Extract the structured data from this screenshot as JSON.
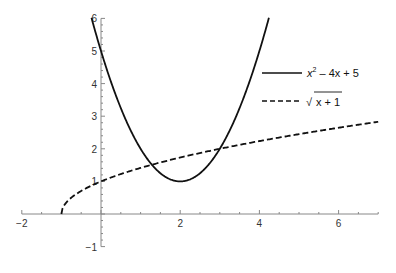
{
  "chart_data": {
    "type": "line",
    "title": "",
    "xlabel": "",
    "ylabel": "",
    "xlim": [
      -2,
      7
    ],
    "ylim": [
      -1,
      6
    ],
    "x_ticks": [
      -2,
      2,
      4,
      6
    ],
    "y_ticks": [
      -1,
      1,
      2,
      3,
      4,
      5,
      6
    ],
    "grid": false,
    "legend_position": "right-inside",
    "series": [
      {
        "name": "x^2 - 4x + 5",
        "style": "solid",
        "color": "#111111",
        "function": "x^2 - 4x + 5",
        "x": [
          -0.24,
          0,
          0.5,
          1,
          1.5,
          2,
          2.5,
          3,
          3.5,
          4,
          4.24
        ],
        "y": [
          6.0,
          5.0,
          3.25,
          2.0,
          1.25,
          1.0,
          1.25,
          2.0,
          3.25,
          5.0,
          6.0
        ]
      },
      {
        "name": "sqrt(x+1)",
        "style": "dashed",
        "color": "#111111",
        "function": "sqrt(x+1)",
        "x": [
          -1,
          -0.75,
          0,
          1,
          2,
          3,
          4,
          5,
          6,
          7
        ],
        "y": [
          0,
          0.5,
          1.0,
          1.414,
          1.732,
          2.0,
          2.236,
          2.449,
          2.646,
          2.828
        ]
      }
    ],
    "intersections": [
      [
        1.38,
        1.54
      ],
      [
        3.0,
        2.0
      ]
    ]
  },
  "legend": {
    "items": [
      {
        "label_base": "x",
        "label_sup": "2",
        "label_rest": " – 4x + 5",
        "style": "solid"
      },
      {
        "label": "x + 1",
        "prefix": "√",
        "style": "dashed"
      }
    ]
  },
  "axes": {
    "x_tick_labels": [
      "−2",
      "2",
      "4",
      "6"
    ],
    "y_tick_labels": [
      "−1",
      "1",
      "2",
      "3",
      "4",
      "5",
      "6"
    ]
  }
}
